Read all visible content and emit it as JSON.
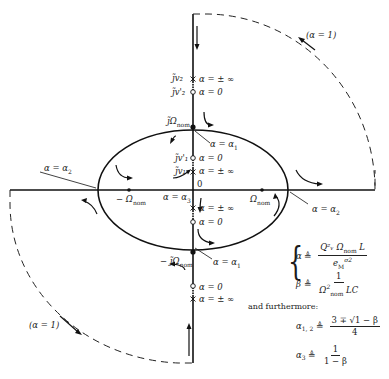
{
  "diagram": {
    "type": "root-locus",
    "axes": {
      "horizontal": "real axis",
      "vertical": "imaginary axis",
      "origin_label": "0"
    },
    "labels": {
      "jv2": "j̃v₂",
      "jv2_alpha": "α = ± ∞",
      "jv2p": "j̃v'₂",
      "jv2p_alpha": "α = 0",
      "jOmega_nom": "j̃Ω",
      "jOmega_nom_sub": "nom",
      "alpha1_top": "α = α",
      "alpha1_top_sub": "1",
      "jv1p": "j̃v'₁",
      "jv1p_alpha": "α = 0",
      "jv1": "j̃v₁",
      "jv1_alpha": "α = ± ∞",
      "origin": "0",
      "alpha3": "α = α",
      "alpha3_sub": "3",
      "neg_omega": "− Ω",
      "neg_omega_sub": "nom",
      "pos_omega": "Ω",
      "pos_omega_sub": "nom",
      "alpha2_left": "α = α",
      "alpha2_left_sub": "2",
      "alpha2_right": "α = α",
      "alpha2_right_sub": "2",
      "lower_inf_1": "α = ± ∞",
      "lower_zero_1": "α = 0",
      "neg_jOmega": "− j̃Ω",
      "neg_jOmega_sub": "nom",
      "alpha1_bottom": "α = α",
      "alpha1_bottom_sub": "1",
      "lower_zero_2": "α = 0",
      "lower_inf_2": "α = ± ∞",
      "alpha_one_top": "(α = 1)",
      "alpha_one_bottom": "(α = 1)"
    },
    "definitions": {
      "alpha_lhs": "α",
      "defeq": "≜",
      "alpha_num": "Q²ᵥ Ω",
      "alpha_num_sub": "nom",
      "alpha_num_tail": " L",
      "alpha_den": "e",
      "alpha_den_sub": "M",
      "alpha_den_sup": "σ2",
      "beta_lhs": "β",
      "beta_num": "1",
      "beta_den": "Ω",
      "beta_den_sup": "2",
      "beta_den_sub": "nom",
      "beta_den_tail": " LC",
      "furthermore": "and furthermore:",
      "a12_lhs": "α",
      "a12_sub": "1, 2",
      "a12_num": "3 ∓ √1 − β",
      "a12_den": "4",
      "a3_lhs": "α",
      "a3_sub": "3",
      "a3_num": "1",
      "a3_den": "1 − β"
    }
  }
}
